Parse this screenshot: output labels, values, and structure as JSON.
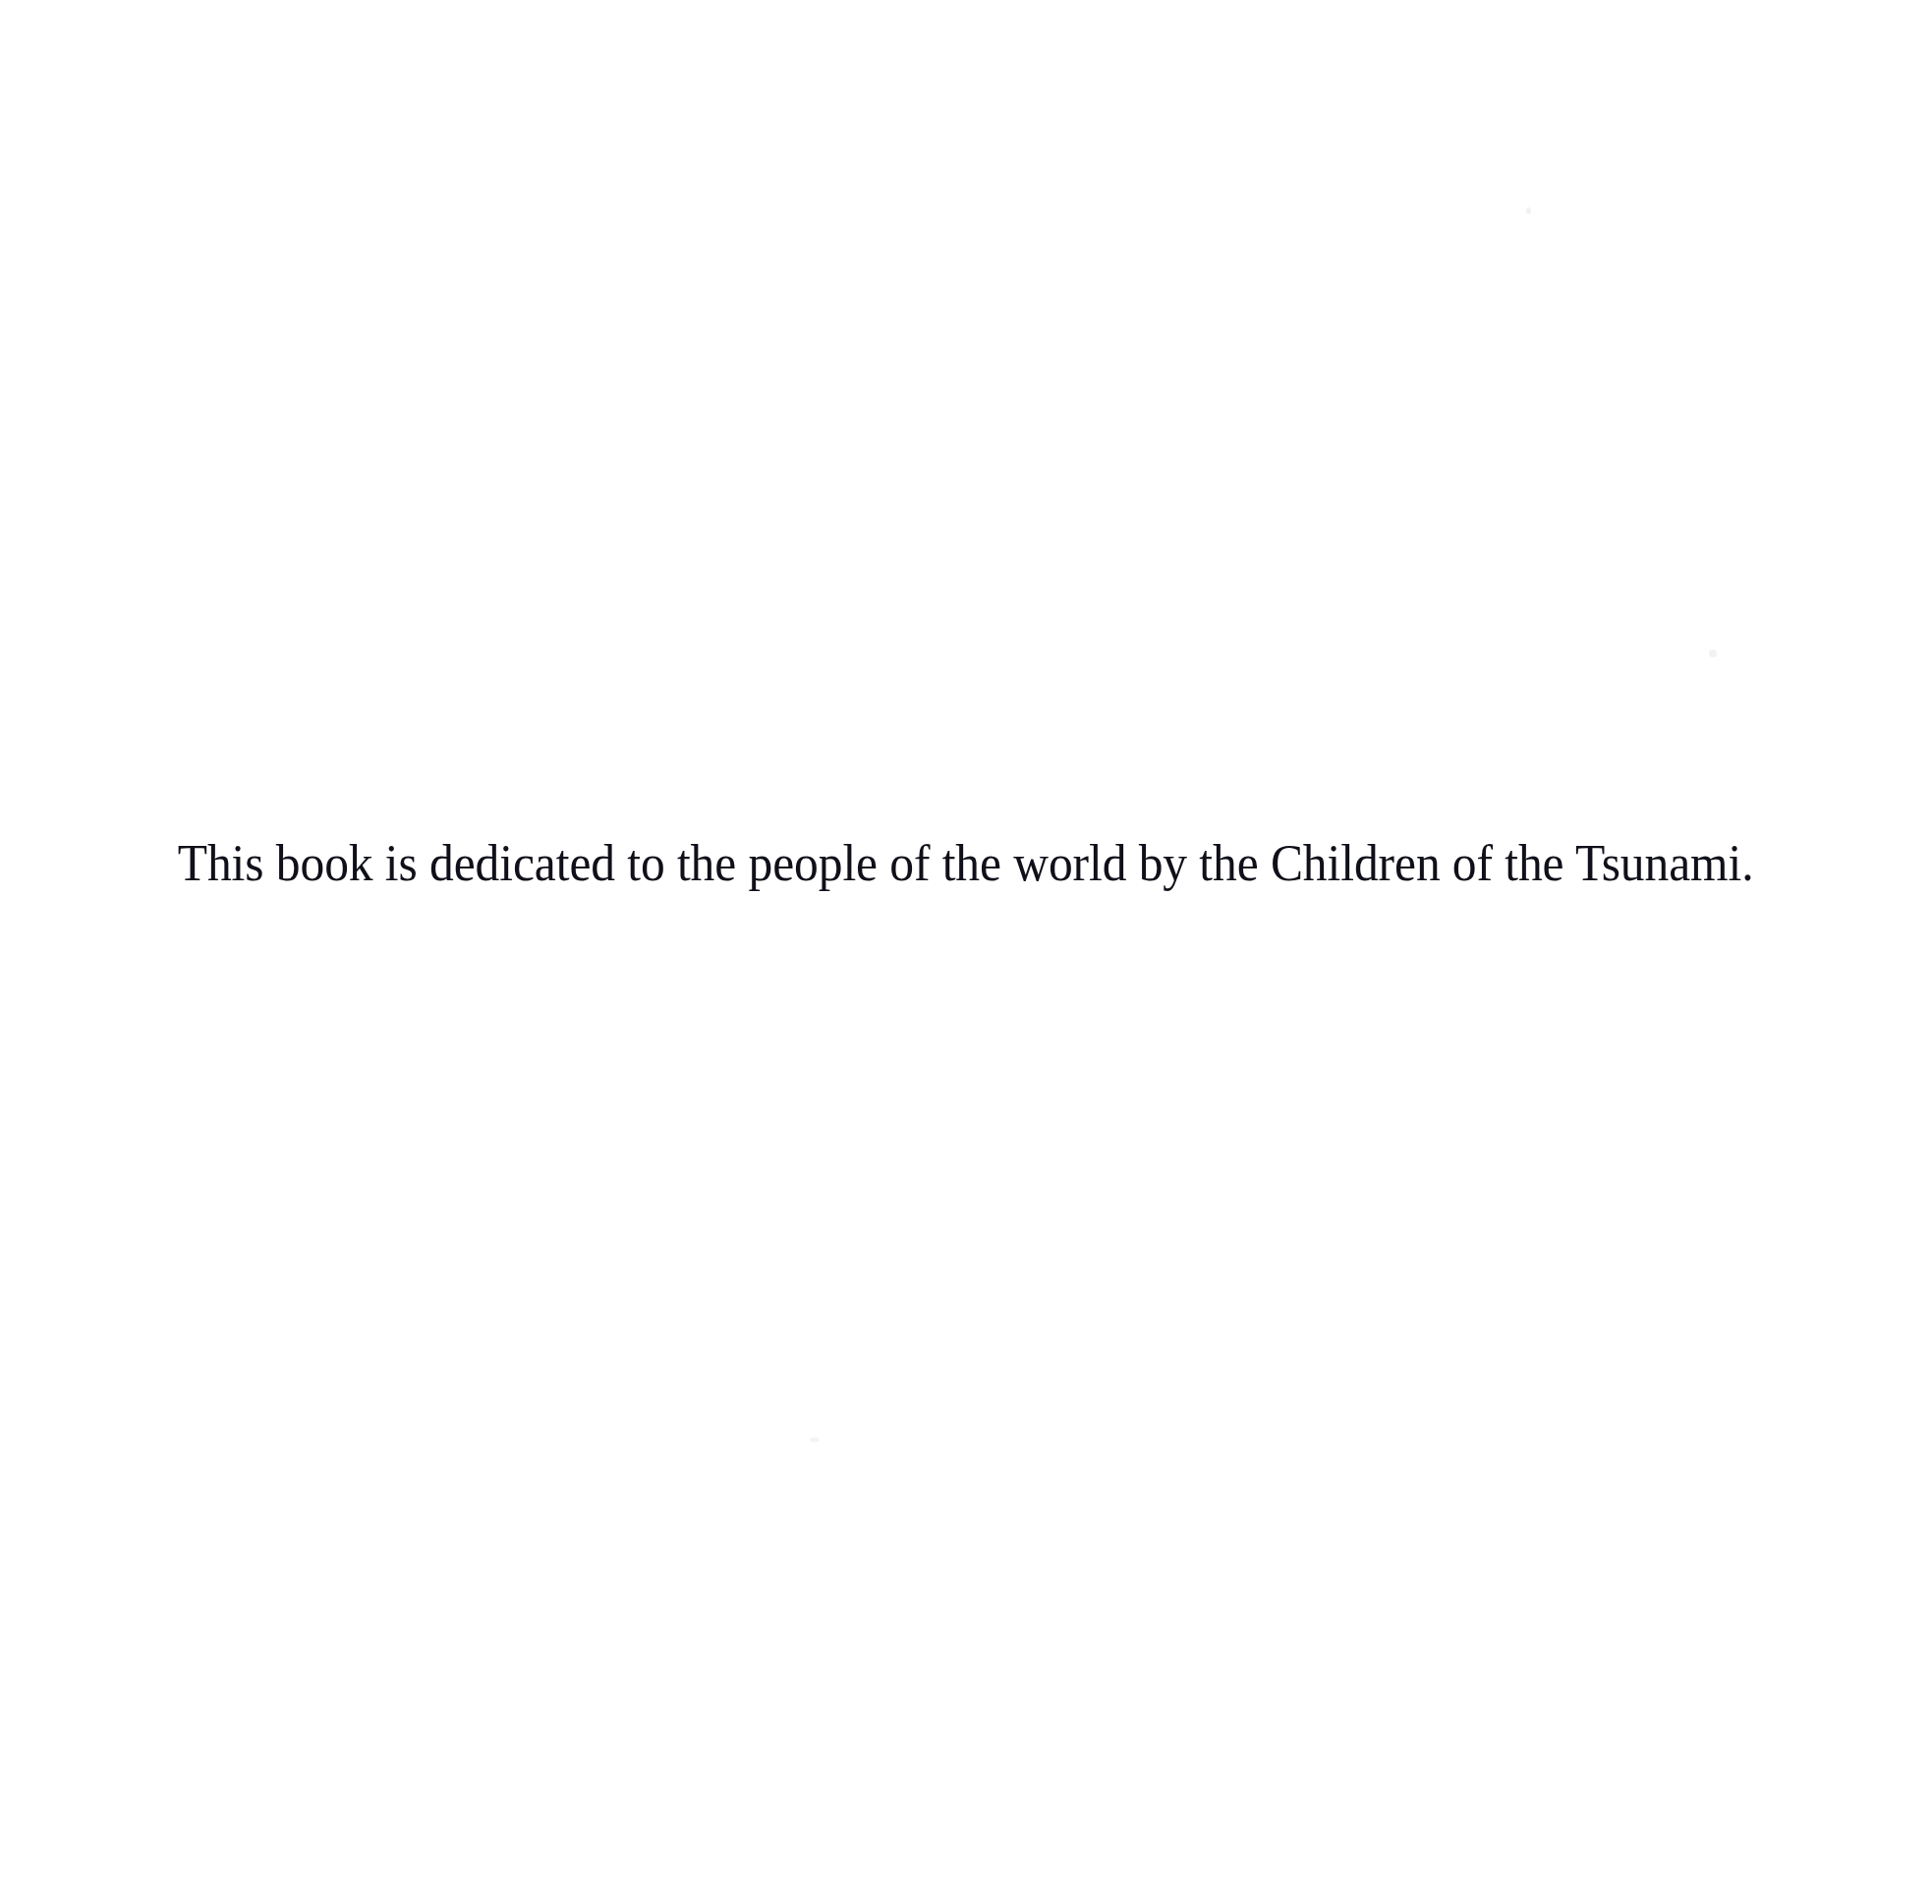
{
  "page": {
    "kind": "book-dedication-page",
    "background_color": "#ffffff",
    "width": 1966,
    "height": 1938
  },
  "dedication": {
    "text": "This book is dedicated to the people of the world by the Children of the Tsunami.",
    "text_color": "#10101a",
    "alignment": "center"
  },
  "artifacts": {
    "speck_1": "",
    "speck_2": "",
    "speck_3": ""
  }
}
